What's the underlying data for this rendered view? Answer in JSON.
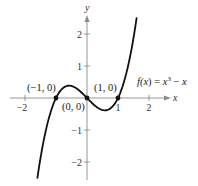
{
  "chart_data": {
    "type": "line",
    "title": "",
    "function_label": {
      "name": "f",
      "var": "x",
      "expr_parts": [
        "f(",
        "x",
        ") = ",
        "x",
        "3",
        " − ",
        "x"
      ],
      "text": "f(x) = x³ − x"
    },
    "xlabel": "x",
    "ylabel": "y",
    "xlim": [
      -2.6,
      2.7
    ],
    "ylim": [
      -2.5,
      2.6
    ],
    "grid": false,
    "legend": null,
    "x_ticks": [
      -2,
      -1,
      1,
      2
    ],
    "x_tick_labels": [
      "−2",
      "",
      "1",
      "2"
    ],
    "y_ticks": [
      -2,
      -1,
      1,
      2
    ],
    "y_tick_labels": [
      "−2",
      "−1",
      "1",
      "2"
    ],
    "series": [
      {
        "name": "f(x) = x³ − x",
        "domain": [
          -1.6,
          1.6
        ],
        "x": [
          -1.6,
          -1.4,
          -1.2,
          -1.0,
          -0.8,
          -0.577,
          -0.4,
          -0.2,
          0,
          0.2,
          0.4,
          0.577,
          0.8,
          1.0,
          1.2,
          1.4,
          1.6
        ],
        "y": [
          -2.496,
          -1.344,
          -0.528,
          0,
          0.288,
          0.385,
          0.336,
          0.192,
          0,
          -0.192,
          -0.336,
          -0.385,
          -0.288,
          0,
          0.528,
          1.344,
          2.496
        ]
      }
    ],
    "annotations": [
      {
        "label": "(−1, 0)",
        "x": -1,
        "y": 0,
        "marker": "dot"
      },
      {
        "label": "(0, 0)",
        "x": 0,
        "y": 0,
        "marker": "dot"
      },
      {
        "label": "(1, 0)",
        "x": 1,
        "y": 0,
        "marker": "dot"
      }
    ]
  },
  "layout": {
    "origin_px": [
      87,
      98
    ],
    "scale_x_px": 31,
    "scale_y_px": 32,
    "colors": {
      "axis": "#8a8a8a",
      "curve": "#111111",
      "text": "#333333"
    }
  }
}
